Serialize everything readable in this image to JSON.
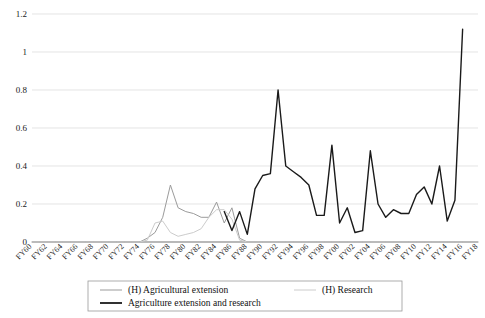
{
  "chart_data": {
    "type": "line",
    "title": "",
    "xlabel": "",
    "ylabel": "",
    "ylim": [
      0,
      1.2
    ],
    "yticks": [
      "0",
      "0.2",
      "0.4",
      "0.6",
      "0.8",
      "1",
      "1.2"
    ],
    "ytick_values": [
      0,
      0.2,
      0.4,
      0.6,
      0.8,
      1,
      1.2
    ],
    "grid": true,
    "legend_position": "bottom",
    "categories": [
      "FY60",
      "FY61",
      "FY62",
      "FY63",
      "FY64",
      "FY65",
      "FY66",
      "FY67",
      "FY68",
      "FY69",
      "FY70",
      "FY71",
      "FY72",
      "FY73",
      "FY74",
      "FY75",
      "FY76",
      "FY77",
      "FY78",
      "FY79",
      "FY80",
      "FY81",
      "FY82",
      "FY83",
      "FY84",
      "FY85",
      "FY86",
      "FY87",
      "FY88",
      "FY89",
      "FY90",
      "FY91",
      "FY92",
      "FY93",
      "FY94",
      "FY95",
      "FY96",
      "FY97",
      "FY98",
      "FY99",
      "FY00",
      "FY01",
      "FY02",
      "FY03",
      "FY04",
      "FY05",
      "FY06",
      "FY07",
      "FY08",
      "FY09",
      "FY10",
      "FY11",
      "FY12",
      "FY13",
      "FY14",
      "FY15",
      "FY16",
      "FY17",
      "FY18"
    ],
    "xtick_labels": [
      "FY60",
      "FY62",
      "FY64",
      "FY66",
      "FY68",
      "FY70",
      "FY72",
      "FY74",
      "FY76",
      "FY78",
      "FY80",
      "FY82",
      "FY84",
      "FY86",
      "FY88",
      "FY90",
      "FY92",
      "FY94",
      "FY96",
      "FY98",
      "FY00",
      "FY02",
      "FY04",
      "FY06",
      "FY08",
      "FY10",
      "FY12",
      "FY14",
      "FY16",
      "FY18"
    ],
    "series": [
      {
        "name": "(H) Agricultural extension",
        "color": "#9b9b9b",
        "width": 1.0,
        "values": [
          0,
          0,
          0,
          0,
          0,
          0,
          0,
          0,
          0,
          0,
          0,
          0,
          0,
          0,
          0,
          0.02,
          0.05,
          0.13,
          0.3,
          0.18,
          0.16,
          0.15,
          0.13,
          0.13,
          0.21,
          0.1,
          0.18,
          0.02,
          0,
          0,
          0,
          0,
          0,
          0,
          0,
          0,
          0,
          0,
          0,
          0,
          0,
          0,
          0,
          0,
          0,
          0,
          0,
          0,
          0,
          0,
          0,
          0,
          0,
          0,
          0,
          0,
          0,
          0,
          0
        ]
      },
      {
        "name": "(H) Research",
        "color": "#cccccc",
        "width": 1.0,
        "values": [
          0,
          0,
          0,
          0,
          0,
          0,
          0,
          0,
          0,
          0,
          0,
          0,
          0,
          0,
          0,
          0.01,
          0.1,
          0.11,
          0.05,
          0.03,
          0.04,
          0.05,
          0.07,
          0.13,
          0.17,
          0.17,
          0.12,
          0.01,
          0,
          0,
          0,
          0,
          0,
          0,
          0,
          0,
          0,
          0,
          0,
          0,
          0,
          0,
          0,
          0,
          0,
          0,
          0,
          0,
          0,
          0,
          0,
          0,
          0,
          0,
          0,
          0,
          0,
          0,
          0
        ]
      },
      {
        "name": "Agriculture extension and research",
        "color": "#1a1a1a",
        "width": 1.4,
        "values": [
          null,
          null,
          null,
          null,
          null,
          null,
          null,
          null,
          null,
          null,
          null,
          null,
          null,
          null,
          null,
          null,
          null,
          null,
          null,
          null,
          null,
          null,
          null,
          null,
          null,
          0.16,
          0.06,
          0.16,
          0.04,
          0.28,
          0.35,
          0.36,
          0.8,
          0.4,
          0.37,
          0.34,
          0.3,
          0.14,
          0.14,
          0.51,
          0.1,
          0.18,
          0.05,
          0.06,
          0.48,
          0.2,
          0.13,
          0.17,
          0.15,
          0.15,
          0.25,
          0.29,
          0.2,
          0.4,
          0.11,
          0.22,
          1.12,
          null,
          null
        ]
      }
    ],
    "legend": [
      {
        "label": "(H) Agricultural extension",
        "color": "#9b9b9b",
        "width": 1.0
      },
      {
        "label": "(H) Research",
        "color": "#cccccc",
        "width": 1.0
      },
      {
        "label": "Agriculture extension and research",
        "color": "#1a1a1a",
        "width": 1.8
      }
    ]
  }
}
